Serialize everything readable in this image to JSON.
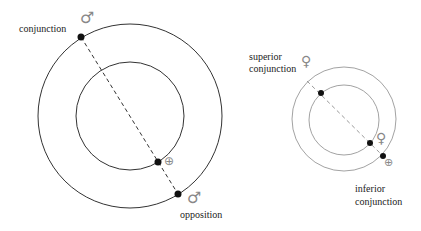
{
  "left_diagram": {
    "title": "Mars (superior planet) configurations",
    "labels": {
      "conjunction": "conjunction",
      "opposition": "opposition"
    },
    "symbols": {
      "mars_conjunction": "♂",
      "mars_opposition": "♂",
      "earth": "⊕"
    }
  },
  "right_diagram": {
    "title": "Venus (inferior planet) configurations",
    "labels": {
      "superior_line1": "superior",
      "superior_line2": "conjunction",
      "inferior_line1": "inferior",
      "inferior_line2": "conjunction"
    },
    "symbols": {
      "venus_superior": "♀",
      "venus_inferior": "♀",
      "earth": "⊕"
    }
  },
  "colors": {
    "orbit_left": "#333333",
    "orbit_right": "#8a8a8a",
    "dot": "#111111",
    "dashed_left": "#333333",
    "dashed_right": "#999999",
    "symbol": "#888888"
  }
}
